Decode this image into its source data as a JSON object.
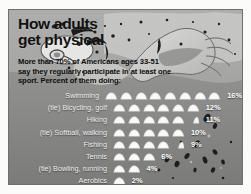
{
  "headline": {
    "line1": "How adults",
    "line2": "get physical"
  },
  "subhead": {
    "line1": "More than 70% of Americans ages 33-51",
    "line2": "say they regularly participate in at least one",
    "line3": "sport.  Percent of them doing:"
  },
  "artwork": {
    "name": "swimmer-illustration",
    "alt": "Swimmer doing freestyle stroke with splashing water"
  },
  "colors": {
    "panel_background": "#8d8d8d",
    "headline_text": "#111111",
    "label_text": "#efefef",
    "value_text": "#ffffff",
    "icon_fill": "#f4f4f2"
  },
  "chart_data": {
    "type": "bar",
    "title": "How adults get physical",
    "subtitle": "More than 70% of Americans ages 33-51 say they regularly participate in at least one sport.  Percent of them doing:",
    "xlabel": "",
    "ylabel": "",
    "xlim": [
      0,
      16
    ],
    "grid": false,
    "legend": "none",
    "unit": "%",
    "icon_unit_value": 2,
    "icon_name": "water-bump-icon",
    "categories": [
      "Swimming",
      "(tie) Bicycling, golf",
      "Hiking",
      "(tie) Softball, walking",
      "Fishing",
      "Tennis",
      "(tie) Bowling, running",
      "Aerobics"
    ],
    "values": [
      16,
      12,
      11,
      10,
      9,
      6,
      4,
      2
    ],
    "value_labels": [
      "16%",
      "12%",
      "11%",
      "10%",
      "9%",
      "6%",
      "4%",
      "2%"
    ],
    "rows": [
      {
        "label": "Swimming",
        "value": 16,
        "value_label": "16%",
        "full_icons": 8,
        "half_icon": false
      },
      {
        "label": "(tie) Bicycling, golf",
        "value": 12,
        "value_label": "12%",
        "full_icons": 6,
        "half_icon": false
      },
      {
        "label": "Hiking",
        "value": 11,
        "value_label": "11%",
        "full_icons": 5,
        "half_icon": true
      },
      {
        "label": "(tie) Softball, walking",
        "value": 10,
        "value_label": "10%",
        "full_icons": 5,
        "half_icon": false
      },
      {
        "label": "Fishing",
        "value": 9,
        "value_label": "9%",
        "full_icons": 4,
        "half_icon": true
      },
      {
        "label": "Tennis",
        "value": 6,
        "value_label": "6%",
        "full_icons": 3,
        "half_icon": false
      },
      {
        "label": "(tie) Bowling, running",
        "value": 4,
        "value_label": "4%",
        "full_icons": 2,
        "half_icon": false
      },
      {
        "label": "Aerobics",
        "value": 2,
        "value_label": "2%",
        "full_icons": 1,
        "half_icon": false
      }
    ]
  }
}
